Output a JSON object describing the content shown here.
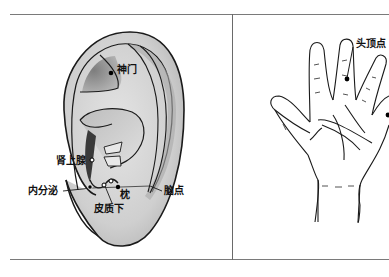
{
  "figure": {
    "panels": [
      {
        "id": "ear",
        "description": "auricular acupoints",
        "points": [
          {
            "label": "神门",
            "marker": "black"
          },
          {
            "label": "肾上腺",
            "marker": "white"
          },
          {
            "label": "内分泌",
            "marker": "black"
          },
          {
            "label": "皮质下",
            "marker": "white"
          },
          {
            "label": "枕",
            "marker": "black"
          },
          {
            "label": "脑点",
            "marker": "white"
          }
        ]
      },
      {
        "id": "hand",
        "description": "hand acupoints",
        "points": [
          {
            "label": "头顶点",
            "marker": "black"
          }
        ]
      }
    ],
    "colors": {
      "frame": "#7a7a7a",
      "outline": "#1a1a1a",
      "ear_fill": "#d9d9d9",
      "ear_shadow": "#8c8c8c",
      "background": "#ffffff"
    }
  }
}
